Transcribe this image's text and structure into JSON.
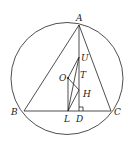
{
  "diagram": {
    "type": "geometry",
    "circle": {
      "cx": 67,
      "cy": 78.5,
      "r": 56
    },
    "points": {
      "A": {
        "x": 79,
        "y": 25,
        "label": "A",
        "lx": 76,
        "ly": 20
      },
      "B": {
        "x": 24,
        "y": 111,
        "label": "B",
        "lx": 10,
        "ly": 115
      },
      "C": {
        "x": 111,
        "y": 111,
        "label": "C",
        "lx": 114,
        "ly": 115
      },
      "L": {
        "x": 68,
        "y": 111,
        "label": "L",
        "lx": 64,
        "ly": 121
      },
      "D": {
        "x": 79,
        "y": 111,
        "label": "D",
        "lx": 76,
        "ly": 121
      },
      "O": {
        "x": 68,
        "y": 78,
        "label": "O",
        "lx": 58,
        "ly": 81
      },
      "U": {
        "x": 79,
        "y": 57,
        "label": "U",
        "lx": 81,
        "ly": 61
      },
      "T": {
        "x": 79,
        "y": 79,
        "label": "T",
        "lx": 80,
        "ly": 78
      },
      "H": {
        "x": 79,
        "y": 90,
        "label": "H",
        "lx": 83,
        "ly": 97
      }
    },
    "labels": [
      "A",
      "B",
      "C",
      "L",
      "D",
      "O",
      "U",
      "T",
      "H"
    ],
    "segments": [
      [
        "A",
        "B"
      ],
      [
        "A",
        "C"
      ],
      [
        "B",
        "C"
      ],
      [
        "A",
        "D"
      ],
      [
        "O",
        "L"
      ],
      [
        "O",
        "U"
      ],
      [
        "O",
        "H"
      ],
      [
        "L",
        "U"
      ],
      [
        "L",
        "H"
      ]
    ],
    "right_angle_at": "D"
  }
}
